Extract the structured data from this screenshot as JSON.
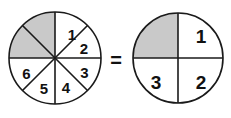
{
  "figure": {
    "relation_symbol": "=",
    "colors": {
      "shaded_fill": "#c9c9c9",
      "unshaded_fill": "#ffffff",
      "stroke": "#1a1a1a",
      "background": "#ffffff"
    },
    "left_circle": {
      "name": "eighths-circle",
      "total_sectors": 8,
      "shaded_sectors": 2,
      "center": {
        "x": 55,
        "y": 58
      },
      "radius": 46,
      "sectors": [
        {
          "index": 1,
          "label": "",
          "shaded": true,
          "start_deg": 270,
          "end_deg": 315
        },
        {
          "index": 2,
          "label": "",
          "shaded": true,
          "start_deg": 315,
          "end_deg": 360
        },
        {
          "index": 3,
          "label": "1",
          "shaded": false,
          "start_deg": 0,
          "end_deg": 45
        },
        {
          "index": 4,
          "label": "2",
          "shaded": false,
          "start_deg": 45,
          "end_deg": 90
        },
        {
          "index": 5,
          "label": "3",
          "shaded": false,
          "start_deg": 90,
          "end_deg": 135
        },
        {
          "index": 6,
          "label": "4",
          "shaded": false,
          "start_deg": 135,
          "end_deg": 180
        },
        {
          "index": 7,
          "label": "5",
          "shaded": false,
          "start_deg": 180,
          "end_deg": 225
        },
        {
          "index": 8,
          "label": "6",
          "shaded": false,
          "start_deg": 225,
          "end_deg": 270
        }
      ],
      "labels": [
        "1",
        "2",
        "3",
        "4",
        "5",
        "6"
      ]
    },
    "right_circle": {
      "name": "fourths-circle",
      "total_sectors": 4,
      "shaded_sectors": 1,
      "center": {
        "x": 178,
        "y": 58
      },
      "radius": 45,
      "sectors": [
        {
          "index": 1,
          "label": "",
          "shaded": true,
          "start_deg": 270,
          "end_deg": 360
        },
        {
          "index": 2,
          "label": "1",
          "shaded": false,
          "start_deg": 0,
          "end_deg": 90
        },
        {
          "index": 3,
          "label": "2",
          "shaded": false,
          "start_deg": 90,
          "end_deg": 180
        },
        {
          "index": 4,
          "label": "3",
          "shaded": false,
          "start_deg": 180,
          "end_deg": 270
        }
      ],
      "labels": [
        "1",
        "2",
        "3"
      ]
    }
  }
}
